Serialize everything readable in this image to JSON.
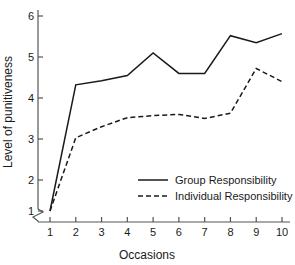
{
  "chart_data": {
    "type": "line",
    "title": "",
    "xlabel": "Occasions",
    "ylabel": "Level of punitiveness",
    "x": [
      1,
      2,
      3,
      4,
      5,
      6,
      7,
      8,
      9,
      10
    ],
    "xtick_labels": [
      "1",
      "2",
      "3",
      "4",
      "5",
      "6",
      "7",
      "8",
      "9",
      "10"
    ],
    "ytick_labels": [
      "1",
      "2",
      "3",
      "4",
      "5",
      "6"
    ],
    "yticks": [
      1,
      2,
      3,
      4,
      5,
      6
    ],
    "xlim": [
      1,
      10
    ],
    "ylim": [
      1,
      6
    ],
    "grid": false,
    "y_axis_break": true,
    "legend_position": "inside-lower-right",
    "series": [
      {
        "name": "Group Responsibility",
        "style": "solid",
        "color": "#1a1a1a",
        "values": [
          1.95,
          4.32,
          4.42,
          4.55,
          5.1,
          4.6,
          4.6,
          5.52,
          5.35,
          5.57
        ]
      },
      {
        "name": "Individual Responsibility",
        "style": "dashed",
        "color": "#1a1a1a",
        "values": [
          1.85,
          3.03,
          3.3,
          3.52,
          3.57,
          3.6,
          3.5,
          3.63,
          4.72,
          4.4
        ]
      }
    ]
  },
  "legend": {
    "entries": [
      {
        "label": "Group Responsibility"
      },
      {
        "label": "Individual Responsibility"
      }
    ]
  },
  "axes": {
    "x_title": "Occasions",
    "y_title": "Level of punitiveness"
  }
}
